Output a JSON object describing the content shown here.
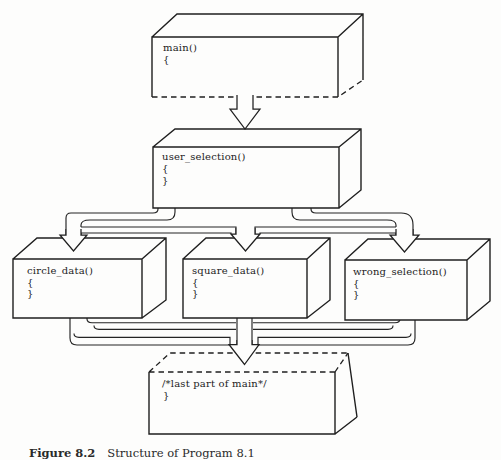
{
  "figure": {
    "boxes": {
      "main": {
        "lines": [
          "main()",
          "{"
        ]
      },
      "user_selection": {
        "lines": [
          "user_selection()",
          "{",
          "}"
        ]
      },
      "circle_data": {
        "lines": [
          "circle_data()",
          "{",
          "}"
        ]
      },
      "square_data": {
        "lines": [
          "square_data()",
          "{",
          "}"
        ]
      },
      "wrong_selection": {
        "lines": [
          "wrong_selection()",
          "{",
          "}"
        ]
      },
      "last": {
        "lines": [
          "/*last part of main*/",
          "}"
        ]
      }
    },
    "connectors": [
      "main to user_selection",
      "user_selection to circle_data",
      "user_selection to square_data",
      "user_selection to wrong_selection",
      "circle_data to last part of main",
      "square_data to last part of main",
      "wrong_selection to last part of main"
    ],
    "caption": {
      "label": "Figure 8.2",
      "title": "Structure of Program 8.1"
    },
    "colors": {
      "ink": "#1f1f1f",
      "paper": "#fdfdfc"
    }
  }
}
